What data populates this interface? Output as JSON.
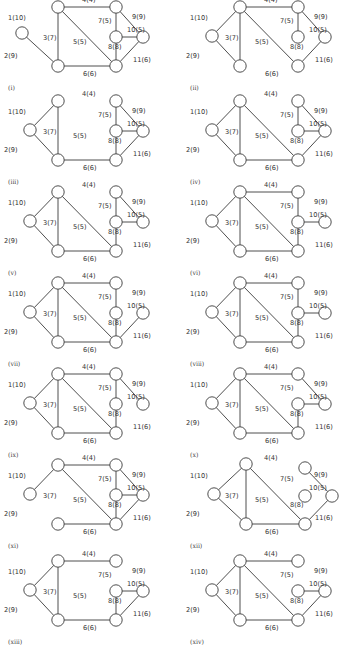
{
  "figure": {
    "edge_labels": {
      "e1": "1(10)",
      "e2": "2(9)",
      "e3": "3(7)",
      "e4": "4(4)",
      "e5": "5(5)",
      "e6": "6(6)",
      "e7": "7(5)",
      "e8": "8(8)",
      "e9": "9(9)",
      "e10": "10(5)",
      "e11": "11(6)"
    },
    "edge_endpoints": {
      "e1": [
        "A",
        "B"
      ],
      "e2": [
        "A",
        "C"
      ],
      "e3": [
        "B",
        "C"
      ],
      "e4": [
        "B",
        "D"
      ],
      "e5": [
        "B",
        "F"
      ],
      "e6": [
        "C",
        "F"
      ],
      "e7": [
        "D",
        "E"
      ],
      "e8": [
        "E",
        "F"
      ],
      "e9": [
        "D",
        "G"
      ],
      "e10": [
        "E",
        "G"
      ],
      "e11": [
        "F",
        "G"
      ]
    },
    "panels": [
      {
        "label": "(i)",
        "edges_drawn": [
          "e2",
          "e3",
          "e4",
          "e5",
          "e6",
          "e7",
          "e8",
          "e9",
          "e10",
          "e11"
        ]
      },
      {
        "label": "(ii)",
        "edges_drawn": [
          "e1",
          "e2",
          "e3",
          "e4",
          "e5",
          "e7",
          "e9",
          "e11"
        ]
      },
      {
        "label": "(iii)",
        "edges_drawn": [
          "e1",
          "e2",
          "e3",
          "e6",
          "e7",
          "e8",
          "e9",
          "e10",
          "e11"
        ]
      },
      {
        "label": "(iv)",
        "edges_drawn": [
          "e1",
          "e2",
          "e3",
          "e5",
          "e6",
          "e7",
          "e9",
          "e10",
          "e11"
        ]
      },
      {
        "label": "(v)",
        "edges_drawn": [
          "e1",
          "e2",
          "e3",
          "e5",
          "e6",
          "e7",
          "e8",
          "e9",
          "e10"
        ]
      },
      {
        "label": "(vi)",
        "edges_drawn": [
          "e1",
          "e2",
          "e3",
          "e4",
          "e5",
          "e6",
          "e7",
          "e8",
          "e10"
        ]
      },
      {
        "label": "(vii)",
        "edges_drawn": [
          "e1",
          "e2",
          "e3",
          "e4",
          "e5",
          "e6",
          "e7",
          "e8",
          "e11"
        ]
      },
      {
        "label": "(viii)",
        "edges_drawn": [
          "e1",
          "e2",
          "e3",
          "e4",
          "e5",
          "e6",
          "e7",
          "e8",
          "e10"
        ]
      },
      {
        "label": "(ix)",
        "edges_drawn": [
          "e1",
          "e2",
          "e3",
          "e4",
          "e5",
          "e6",
          "e7",
          "e8",
          "e9"
        ]
      },
      {
        "label": "(x)",
        "edges_drawn": [
          "e1",
          "e2",
          "e3",
          "e4",
          "e5",
          "e6",
          "e8",
          "e9",
          "e10"
        ]
      },
      {
        "label": "(xi)",
        "edges_drawn": [
          "e1",
          "e4",
          "e5",
          "e6",
          "e7",
          "e8",
          "e9",
          "e10",
          "e11"
        ]
      },
      {
        "label": "(xii)",
        "edges_drawn": [
          "e1",
          "e2",
          "e3",
          "e5",
          "e6",
          "e9",
          "e11"
        ]
      },
      {
        "label": "(xiii)",
        "edges_drawn": [
          "e1",
          "e2",
          "e3",
          "e4",
          "e6",
          "e8",
          "e10",
          "e11"
        ]
      },
      {
        "label": "(xiv)",
        "edges_drawn": [
          "e1",
          "e2",
          "e3",
          "e4",
          "e5",
          "e6",
          "e10",
          "e11"
        ]
      }
    ]
  }
}
